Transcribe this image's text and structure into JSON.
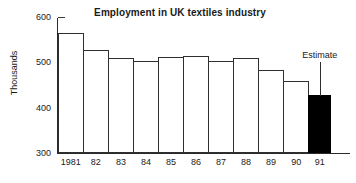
{
  "chart_data": {
    "type": "bar",
    "title": "Employment in UK textiles industry",
    "xlabel": "",
    "ylabel": "Thousands",
    "categories": [
      "1981",
      "82",
      "83",
      "84",
      "85",
      "86",
      "87",
      "88",
      "89",
      "90",
      "91"
    ],
    "values": [
      563,
      526,
      509,
      503,
      510,
      513,
      502,
      508,
      483,
      457,
      428
    ],
    "ylim": [
      300,
      600
    ],
    "yticks": [
      300,
      400,
      500,
      600
    ],
    "ytick_labels": [
      "300",
      "400",
      "500",
      "600"
    ],
    "grid": false,
    "legend": "none",
    "bar_colors": [
      "#ffffff",
      "#ffffff",
      "#ffffff",
      "#ffffff",
      "#ffffff",
      "#ffffff",
      "#ffffff",
      "#ffffff",
      "#ffffff",
      "#ffffff",
      "#000000"
    ],
    "bar_edge_color": "#2f2f2f",
    "annotations": [
      {
        "text": "Estimate",
        "target_category": "91"
      }
    ]
  },
  "colors": {
    "background": "#ffffff",
    "axis": "#2b2b2b",
    "text": "#1a1a1a",
    "estimate_fill": "#000000"
  }
}
